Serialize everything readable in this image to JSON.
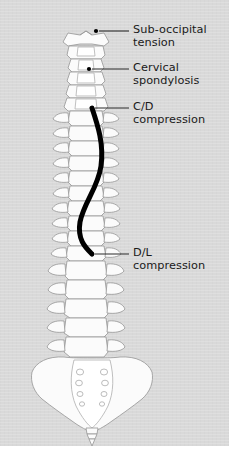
{
  "figure": {
    "type": "anatomical-diagram",
    "panel_color": "#d9d9d9",
    "bone_fill": "#fbfbfb",
    "bone_outline": "#9a9a9a",
    "tension_line_color": "#000000",
    "label_color": "#1a1a1a",
    "leader_color": "#2b2b2b"
  },
  "labels": [
    {
      "id": "sub-occipital-tension",
      "text": "Sub-occipital\ntension",
      "line1": "Sub-occipital",
      "line2": "tension",
      "marker_x": 96,
      "marker_y": 31,
      "leader_to_x": 129,
      "leader_y": 31
    },
    {
      "id": "cervical-spondylosis",
      "text": "Cervical\nspondylosis",
      "line1": "Cervical",
      "line2": "spondylosis",
      "marker_x": 89,
      "marker_y": 69,
      "leader_to_x": 129,
      "leader_y": 69
    },
    {
      "id": "cd-compression",
      "text": "C/D\ncompression",
      "line1": "C/D",
      "line2": "compression",
      "marker_x": 92,
      "marker_y": 108,
      "leader_to_x": 129,
      "leader_y": 108
    },
    {
      "id": "dl-compression",
      "text": "D/L\ncompression",
      "line1": "D/L",
      "line2": "compression",
      "marker_x": 92,
      "marker_y": 254,
      "leader_to_x": 129,
      "leader_y": 254
    }
  ],
  "spine_regions": [
    {
      "name": "atlas",
      "label": "C1 atlas",
      "y_top": 33,
      "y_bottom": 48
    },
    {
      "name": "cervical",
      "label": "cervical vertebrae",
      "y_top": 48,
      "y_bottom": 110
    },
    {
      "name": "thoracic",
      "label": "thoracic vertebrae",
      "y_top": 110,
      "y_bottom": 258
    },
    {
      "name": "lumbar",
      "label": "lumbar vertebrae",
      "y_top": 258,
      "y_bottom": 345
    },
    {
      "name": "sacrum",
      "label": "sacrum",
      "y_top": 345,
      "y_bottom": 412
    },
    {
      "name": "coccyx",
      "label": "coccyx",
      "y_top": 412,
      "y_bottom": 432
    }
  ],
  "tension_curve": {
    "name": "spinal tension line",
    "start": {
      "x": 92,
      "y": 108
    },
    "end": {
      "x": 92,
      "y": 254
    },
    "shape": "sigmoid",
    "stroke_width_px": 5
  }
}
